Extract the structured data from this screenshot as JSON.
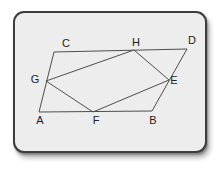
{
  "colors": {
    "page_bg": "#ffffff",
    "card_bg": "#ededed",
    "card_border": "#3d3d3d",
    "line_color": "#4d4d4d",
    "label_color": "#222222"
  },
  "diagram": {
    "labels": {
      "A": "A",
      "B": "B",
      "C": "C",
      "D": "D",
      "E": "E",
      "F": "F",
      "G": "G",
      "H": "H"
    },
    "vertices": {
      "A": {
        "x": 39,
        "y": 112,
        "lx": 40,
        "ly": 124
      },
      "B": {
        "x": 152,
        "y": 111,
        "lx": 153,
        "ly": 124
      },
      "C": {
        "x": 54,
        "y": 52,
        "lx": 66,
        "ly": 47
      },
      "D": {
        "x": 187,
        "y": 49,
        "lx": 192,
        "ly": 44
      },
      "E": {
        "x": 169,
        "y": 80,
        "lx": 174,
        "ly": 84
      },
      "F": {
        "x": 93,
        "y": 112,
        "lx": 96,
        "ly": 124
      },
      "G": {
        "x": 46,
        "y": 81,
        "lx": 35,
        "ly": 83
      },
      "H": {
        "x": 134,
        "y": 50,
        "lx": 136,
        "ly": 46
      }
    },
    "edges": [
      [
        "A",
        "C"
      ],
      [
        "C",
        "D"
      ],
      [
        "D",
        "B"
      ],
      [
        "B",
        "A"
      ],
      [
        "G",
        "H"
      ],
      [
        "H",
        "E"
      ],
      [
        "E",
        "F"
      ],
      [
        "F",
        "G"
      ]
    ]
  }
}
